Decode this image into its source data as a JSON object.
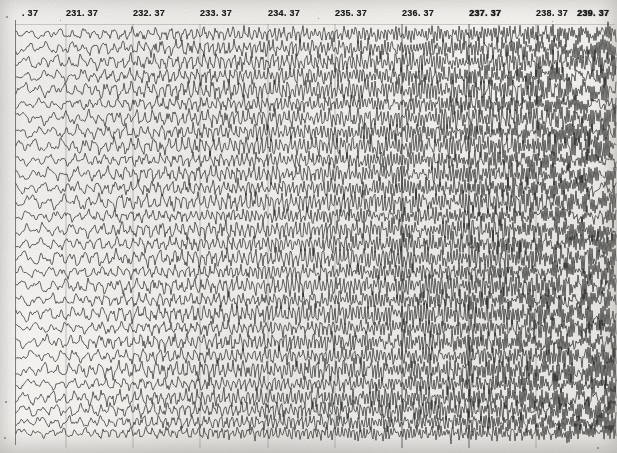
{
  "document": {
    "kind": "strip-chart-recording",
    "description": "Scanned multi-channel analog strip chart (EEG / polygraph style) with dense overlapping oscillatory traces",
    "paper_color": "#f4f3f0",
    "ink_color": "#1d1d1d",
    "width": 617,
    "height": 453
  },
  "header": {
    "tick_labels": [
      {
        "text": ". 37",
        "x": 22,
        "truncated": true,
        "smudged": false
      },
      {
        "text": "231. 37",
        "x": 66,
        "truncated": false,
        "smudged": false
      },
      {
        "text": "232. 37",
        "x": 133,
        "truncated": false,
        "smudged": false
      },
      {
        "text": "233. 37",
        "x": 200,
        "truncated": false,
        "smudged": false
      },
      {
        "text": "234. 37",
        "x": 268,
        "truncated": false,
        "smudged": false
      },
      {
        "text": "235. 37",
        "x": 335,
        "truncated": false,
        "smudged": false
      },
      {
        "text": "236. 37",
        "x": 402,
        "truncated": false,
        "smudged": false
      },
      {
        "text": "237. 37",
        "x": 469,
        "truncated": false,
        "smudged": true
      },
      {
        "text": "238. 37",
        "x": 536,
        "truncated": false,
        "smudged": false
      },
      {
        "text": "239. 37",
        "x": 577,
        "truncated": false,
        "smudged": true
      }
    ]
  },
  "chart_data": {
    "type": "line",
    "title": "",
    "xlabel": "",
    "ylabel": "",
    "grid": true,
    "legend_position": "none",
    "axis": {
      "x_tick_labels": [
        ". 37",
        "231. 37",
        "232. 37",
        "233. 37",
        "234. 37",
        "235. 37",
        "236. 37",
        "237. 37",
        "238. 37",
        "239. 37"
      ],
      "x_tick_pixels": [
        22,
        66,
        133,
        200,
        268,
        335,
        402,
        469,
        536,
        577
      ],
      "x_tick_spacing_px": 67,
      "y_tick_labels": [],
      "x_range_label_first": ". 37",
      "x_range_label_last": "239. 37"
    },
    "channel_count": 30,
    "channel_spacing_px": 14,
    "trace_top_px": 30,
    "trace_bottom_px": 448,
    "series": [
      {
        "name": "ch-01",
        "base_y": 34,
        "amplitude": 9,
        "freq_left": 0.3,
        "freq_right": 1.05,
        "phase": 0.0
      },
      {
        "name": "ch-02",
        "base_y": 48,
        "amplitude": 10,
        "freq_left": 0.28,
        "freq_right": 1.12,
        "phase": 0.51
      },
      {
        "name": "ch-03",
        "base_y": 62,
        "amplitude": 11,
        "freq_left": 0.32,
        "freq_right": 1.0,
        "phase": 1.02
      },
      {
        "name": "ch-04",
        "base_y": 76,
        "amplitude": 10,
        "freq_left": 0.26,
        "freq_right": 1.18,
        "phase": 1.53
      },
      {
        "name": "ch-05",
        "base_y": 90,
        "amplitude": 12,
        "freq_left": 0.34,
        "freq_right": 1.08,
        "phase": 2.04
      },
      {
        "name": "ch-06",
        "base_y": 104,
        "amplitude": 9,
        "freq_left": 0.29,
        "freq_right": 1.15,
        "phase": 2.55
      },
      {
        "name": "ch-07",
        "base_y": 118,
        "amplitude": 11,
        "freq_left": 0.31,
        "freq_right": 1.02,
        "phase": 3.06
      },
      {
        "name": "ch-08",
        "base_y": 132,
        "amplitude": 10,
        "freq_left": 0.27,
        "freq_right": 1.2,
        "phase": 3.57
      },
      {
        "name": "ch-09",
        "base_y": 146,
        "amplitude": 12,
        "freq_left": 0.33,
        "freq_right": 1.06,
        "phase": 4.08
      },
      {
        "name": "ch-10",
        "base_y": 160,
        "amplitude": 9,
        "freq_left": 0.3,
        "freq_right": 1.14,
        "phase": 4.59
      },
      {
        "name": "ch-11",
        "base_y": 174,
        "amplitude": 11,
        "freq_left": 0.28,
        "freq_right": 1.09,
        "phase": 5.1
      },
      {
        "name": "ch-12",
        "base_y": 188,
        "amplitude": 10,
        "freq_left": 0.35,
        "freq_right": 1.16,
        "phase": 5.61
      },
      {
        "name": "ch-13",
        "base_y": 202,
        "amplitude": 12,
        "freq_left": 0.26,
        "freq_right": 1.03,
        "phase": 0.25
      },
      {
        "name": "ch-14",
        "base_y": 216,
        "amplitude": 9,
        "freq_left": 0.32,
        "freq_right": 1.19,
        "phase": 0.76
      },
      {
        "name": "ch-15",
        "base_y": 230,
        "amplitude": 11,
        "freq_left": 0.29,
        "freq_right": 1.07,
        "phase": 1.27
      },
      {
        "name": "ch-16",
        "base_y": 244,
        "amplitude": 10,
        "freq_left": 0.31,
        "freq_right": 1.13,
        "phase": 1.78
      },
      {
        "name": "ch-17",
        "base_y": 258,
        "amplitude": 12,
        "freq_left": 0.27,
        "freq_right": 1.01,
        "phase": 2.29
      },
      {
        "name": "ch-18",
        "base_y": 272,
        "amplitude": 9,
        "freq_left": 0.34,
        "freq_right": 1.17,
        "phase": 2.8
      },
      {
        "name": "ch-19",
        "base_y": 286,
        "amplitude": 11,
        "freq_left": 0.3,
        "freq_right": 1.04,
        "phase": 3.31
      },
      {
        "name": "ch-20",
        "base_y": 300,
        "amplitude": 10,
        "freq_left": 0.28,
        "freq_right": 1.21,
        "phase": 3.82
      },
      {
        "name": "ch-21",
        "base_y": 314,
        "amplitude": 12,
        "freq_left": 0.33,
        "freq_right": 1.1,
        "phase": 4.33
      },
      {
        "name": "ch-22",
        "base_y": 328,
        "amplitude": 9,
        "freq_left": 0.26,
        "freq_right": 1.05,
        "phase": 4.84
      },
      {
        "name": "ch-23",
        "base_y": 342,
        "amplitude": 11,
        "freq_left": 0.32,
        "freq_right": 1.18,
        "phase": 5.35
      },
      {
        "name": "ch-24",
        "base_y": 356,
        "amplitude": 10,
        "freq_left": 0.29,
        "freq_right": 1.02,
        "phase": 5.86
      },
      {
        "name": "ch-25",
        "base_y": 370,
        "amplitude": 12,
        "freq_left": 0.31,
        "freq_right": 1.15,
        "phase": 0.38
      },
      {
        "name": "ch-26",
        "base_y": 384,
        "amplitude": 9,
        "freq_left": 0.27,
        "freq_right": 1.08,
        "phase": 0.89
      },
      {
        "name": "ch-27",
        "base_y": 398,
        "amplitude": 11,
        "freq_left": 0.35,
        "freq_right": 1.2,
        "phase": 1.4
      },
      {
        "name": "ch-28",
        "base_y": 410,
        "amplitude": 10,
        "freq_left": 0.3,
        "freq_right": 1.06,
        "phase": 1.91
      },
      {
        "name": "ch-29",
        "base_y": 422,
        "amplitude": 9,
        "freq_left": 0.28,
        "freq_right": 1.13,
        "phase": 2.42
      },
      {
        "name": "ch-30",
        "base_y": 433,
        "amplitude": 8,
        "freq_left": 0.33,
        "freq_right": 1.11,
        "phase": 2.93
      }
    ],
    "gridlines": [
      {
        "x": 66,
        "strong": false
      },
      {
        "x": 133,
        "strong": false
      },
      {
        "x": 200,
        "strong": false
      },
      {
        "x": 268,
        "strong": false
      },
      {
        "x": 335,
        "strong": false
      },
      {
        "x": 402,
        "strong": true
      },
      {
        "x": 469,
        "strong": true
      },
      {
        "x": 536,
        "strong": false
      }
    ]
  },
  "specks": [
    {
      "x": 6,
      "y": 16,
      "size": 2
    },
    {
      "x": 5,
      "y": 401,
      "size": 2
    },
    {
      "x": 4,
      "y": 437,
      "size": 2
    },
    {
      "x": 60,
      "y": 20,
      "size": 1
    },
    {
      "x": 318,
      "y": 18,
      "size": 1
    },
    {
      "x": 552,
      "y": 21,
      "size": 1
    },
    {
      "x": 597,
      "y": 447,
      "size": 2
    }
  ]
}
